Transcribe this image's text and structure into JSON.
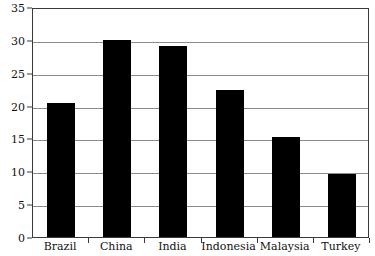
{
  "chart_data": {
    "type": "bar",
    "title": "",
    "subtitle": "",
    "xlabel": "",
    "ylabel": "",
    "categories": [
      "Brazil",
      "China",
      "India",
      "Indonesia",
      "Malaysia",
      "Turkey"
    ],
    "values": [
      20.4,
      30.0,
      29.0,
      22.4,
      15.2,
      9.6
    ],
    "ylim": [
      0,
      35
    ],
    "yticks": [
      0,
      5,
      10,
      15,
      20,
      25,
      30,
      35
    ],
    "ytick_labels": [
      "0",
      "5",
      "10",
      "15",
      "20",
      "25",
      "30",
      "35"
    ],
    "grid": true,
    "grid_axis": "y",
    "legend": false,
    "legend_position": "none",
    "bar_color": "#000000",
    "grid_color": "#8a8a8a",
    "axis_color": "#3a3a3a",
    "background_color": "#ffffff"
  }
}
